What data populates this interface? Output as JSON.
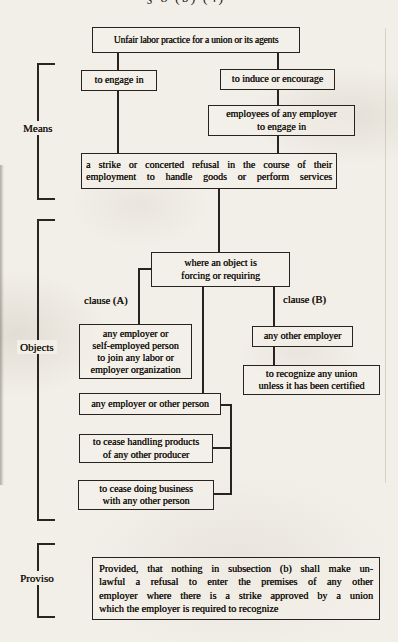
{
  "page": {
    "header_fragment": "§ 8 (b) (4)"
  },
  "diagram": {
    "root_label": "Unfair labor practice for a union or its agents",
    "means": {
      "label": "Means",
      "engage_label": "to engage in",
      "induce_label": "to induce or encourage",
      "employees_lines": [
        "employees of any employer",
        "to engage in"
      ],
      "strike_lines": [
        "a strike or concerted refusal in the course of their",
        "employment to handle goods or perform services"
      ]
    },
    "objects": {
      "label": "Objects",
      "where_lines": [
        "where an object is",
        "forcing or requiring"
      ],
      "clause_a_label": "clause (A)",
      "clause_b_label": "clause (B)",
      "join_org_lines": [
        "any employer or",
        "self-employed person",
        "to join any labor or",
        "employer organization"
      ],
      "any_other_employer_label": "any other employer",
      "recognize_lines": [
        "to recognize any union",
        "unless it has been certified"
      ],
      "employer_or_person_label": "any employer or other person",
      "cease_handling_lines": [
        "to cease handling products",
        "of any other producer"
      ],
      "cease_business_lines": [
        "to cease doing business",
        "with any other person"
      ]
    },
    "proviso": {
      "label": "Proviso",
      "lines": [
        "Provided, that nothing in subsection (b) shall make un-",
        "lawful a refusal to enter the premises of any other",
        "employer where there is a strike approved by a union",
        "which the employer is required to recognize"
      ]
    }
  }
}
